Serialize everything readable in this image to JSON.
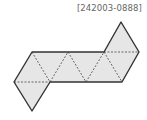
{
  "label": "[242003-0888]",
  "diagram": {
    "type": "octahedron-net",
    "fill": "#e6e6e6",
    "edge_color": "#333333",
    "fold_color": "#444444",
    "triangles": [
      [
        [
          14,
          82
        ],
        [
          32,
          52
        ],
        [
          50,
          82
        ]
      ],
      [
        [
          14,
          82
        ],
        [
          50,
          82
        ],
        [
          32,
          111
        ]
      ],
      [
        [
          32,
          52
        ],
        [
          68,
          52
        ],
        [
          50,
          82
        ]
      ],
      [
        [
          50,
          82
        ],
        [
          68,
          52
        ],
        [
          86,
          82
        ]
      ],
      [
        [
          68,
          52
        ],
        [
          104,
          52
        ],
        [
          86,
          82
        ]
      ],
      [
        [
          86,
          82
        ],
        [
          104,
          52
        ],
        [
          122,
          82
        ]
      ],
      [
        [
          104,
          52
        ],
        [
          139,
          52
        ],
        [
          122,
          82
        ]
      ],
      [
        [
          104,
          52
        ],
        [
          121,
          22
        ],
        [
          139,
          52
        ]
      ]
    ],
    "outline": [
      [
        32,
        52
      ],
      [
        104,
        52
      ],
      [
        121,
        22
      ],
      [
        139,
        52
      ],
      [
        122,
        82
      ],
      [
        50,
        82
      ],
      [
        32,
        111
      ],
      [
        14,
        82
      ]
    ],
    "folds": [
      [
        [
          14,
          82
        ],
        [
          50,
          82
        ]
      ],
      [
        [
          32,
          52
        ],
        [
          50,
          82
        ]
      ],
      [
        [
          50,
          82
        ],
        [
          68,
          52
        ]
      ],
      [
        [
          68,
          52
        ],
        [
          86,
          82
        ]
      ],
      [
        [
          86,
          82
        ],
        [
          104,
          52
        ]
      ],
      [
        [
          104,
          52
        ],
        [
          122,
          82
        ]
      ],
      [
        [
          104,
          52
        ],
        [
          139,
          52
        ]
      ]
    ]
  }
}
